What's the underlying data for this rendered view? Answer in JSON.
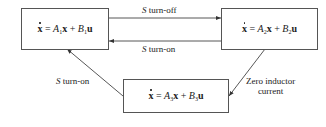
{
  "diagram": {
    "type": "state-transition",
    "states": [
      {
        "id": "state-1",
        "lhs": "x",
        "A": "A",
        "A_sub": "1",
        "B": "B",
        "B_sub": "1",
        "u": "u"
      },
      {
        "id": "state-2",
        "lhs": "x",
        "A": "A",
        "A_sub": "2",
        "B": "B",
        "B_sub": "2",
        "u": "u"
      },
      {
        "id": "state-3",
        "lhs": "x",
        "A": "A",
        "A_sub": "3",
        "B": "B",
        "B_sub": "3",
        "u": "u"
      }
    ],
    "transitions": [
      {
        "from": "state-1",
        "to": "state-2",
        "switch": "S",
        "label": " turn-off"
      },
      {
        "from": "state-2",
        "to": "state-1",
        "switch": "S",
        "label": " turn-on"
      },
      {
        "from": "state-2",
        "to": "state-3",
        "label_line1": "Zero inductor",
        "label_line2": "current"
      },
      {
        "from": "state-3",
        "to": "state-1",
        "switch": "S",
        "label": " turn-on"
      }
    ],
    "eq_symbols": {
      "equals": " = ",
      "plus": " + ",
      "x": "x"
    }
  }
}
